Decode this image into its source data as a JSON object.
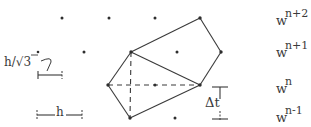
{
  "diagram": {
    "colors": {
      "ink": "#3a3a3a",
      "background": "#ffffff"
    },
    "time_levels": [
      {
        "id": "n+2",
        "base": "w",
        "superscript": "n+2"
      },
      {
        "id": "n+1",
        "base": "w",
        "superscript": "n+1"
      },
      {
        "id": "n",
        "base": "w",
        "superscript": "n"
      },
      {
        "id": "n-1",
        "base": "w",
        "superscript": "n-1"
      }
    ],
    "scale_labels": {
      "half_spacing": "h/√3",
      "spacing": "h",
      "time_step": "Δt"
    },
    "grid_points": [
      {
        "x": 62,
        "y": 18,
        "level": "n+2"
      },
      {
        "x": 109,
        "y": 18,
        "level": "n+2"
      },
      {
        "x": 155,
        "y": 18,
        "level": "n+2"
      },
      {
        "x": 200,
        "y": 18,
        "level": "n+2",
        "vertex": "B"
      },
      {
        "x": 38,
        "y": 52,
        "level": "n+1"
      },
      {
        "x": 84,
        "y": 52,
        "level": "n+1"
      },
      {
        "x": 131,
        "y": 52,
        "level": "n+1",
        "vertex": "A"
      },
      {
        "x": 177,
        "y": 52,
        "level": "n+1"
      },
      {
        "x": 221,
        "y": 52,
        "level": "n+1",
        "vertex": "C"
      },
      {
        "x": 108,
        "y": 85,
        "level": "n",
        "vertex": "F"
      },
      {
        "x": 155,
        "y": 85,
        "level": "n"
      },
      {
        "x": 200,
        "y": 85,
        "level": "n",
        "vertex": "D"
      },
      {
        "x": 130,
        "y": 118,
        "level": "n-1",
        "vertex": "E"
      },
      {
        "x": 175,
        "y": 118,
        "level": "n-1"
      }
    ],
    "solid_edges": [
      [
        "A",
        "B"
      ],
      [
        "B",
        "C"
      ],
      [
        "C",
        "D"
      ],
      [
        "A",
        "D"
      ],
      [
        "A",
        "F"
      ],
      [
        "F",
        "E"
      ],
      [
        "E",
        "D"
      ]
    ],
    "dashed_edges": [
      [
        "F",
        "D"
      ],
      [
        "A",
        "E"
      ]
    ]
  }
}
